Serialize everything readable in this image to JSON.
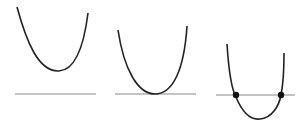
{
  "diagram": {
    "colors": {
      "curve": "#222222",
      "axis": "#888888",
      "root_dot": "#111111",
      "background": "#ffffff"
    },
    "panels": [
      {
        "id": "no-roots",
        "axis": {
          "x1": 15,
          "x2": 96,
          "y": 94
        },
        "curve": {
          "start": [
            17,
            7
          ],
          "vertex": [
            59,
            71
          ],
          "end": [
            88,
            13
          ]
        },
        "roots": []
      },
      {
        "id": "one-root",
        "axis": {
          "x1": 115,
          "x2": 196,
          "y": 94
        },
        "curve": {
          "start": [
            118,
            30
          ],
          "vertex": [
            155,
            94
          ],
          "end": [
            187,
            26
          ]
        },
        "roots": [
          [
            155,
            94
          ]
        ]
      },
      {
        "id": "two-roots",
        "axis": {
          "x1": 216,
          "x2": 295,
          "y": 95
        },
        "curve": {
          "start": [
            227,
            44
          ],
          "vertex": [
            260,
            119
          ],
          "end": [
            284,
            53
          ]
        },
        "roots": [
          [
            236,
            95
          ],
          [
            281,
            95
          ]
        ]
      }
    ]
  }
}
